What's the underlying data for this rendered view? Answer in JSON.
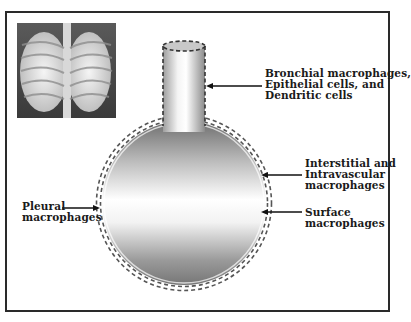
{
  "figure": {
    "inset_image": "chest-xray-lungs",
    "labels": {
      "bronchial": {
        "lines": [
          "Bronchial macrophages,",
          "Epithelial cells, and",
          "Dendritic cells"
        ]
      },
      "interstitial": {
        "lines": [
          "Interstitial and",
          "Intravascular",
          "macrophages"
        ]
      },
      "surface": {
        "lines": [
          "Surface",
          "macrophages"
        ]
      },
      "pleural": {
        "lines": [
          "Pleural",
          "macrophages"
        ]
      }
    },
    "colors": {
      "frame": "#2a2a2a",
      "dashes": "#555555",
      "gradient_dark": "#7a7a7a",
      "gradient_light": "#ffffff"
    }
  }
}
